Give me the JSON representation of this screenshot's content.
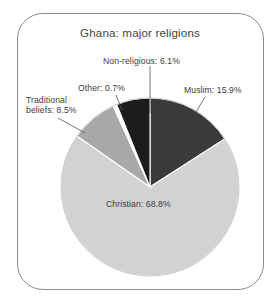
{
  "figure": {
    "title": "Ghana: major religions",
    "frame_color": "#8c8c8c",
    "background": "#ffffff",
    "label_color": "#3b3b3b"
  },
  "chart_data": {
    "type": "pie",
    "title": "Ghana: major religions",
    "xlabel": "",
    "ylabel": "",
    "legend": "none",
    "grid": false,
    "units": "percent",
    "start_angle_deg": 0,
    "direction": "clockwise",
    "categories": [
      "Muslim",
      "Christian",
      "Traditional beliefs",
      "Other",
      "Non-religious"
    ],
    "values": [
      15.9,
      68.8,
      8.5,
      0.7,
      6.1
    ],
    "colors": [
      "#3a3a3a",
      "#d2d2d2",
      "#a8a8a8",
      "#ffffff",
      "#1c1c1c"
    ],
    "slices": [
      {
        "label": "Muslim",
        "value": 15.9,
        "text": "Muslim: 15.9%",
        "color": "#3a3a3a"
      },
      {
        "label": "Christian",
        "value": 68.8,
        "text": "Christian: 68.8%",
        "color": "#d2d2d2"
      },
      {
        "label": "Traditional beliefs",
        "value": 8.5,
        "text": "Traditional beliefs: 8.5%",
        "color": "#a8a8a8"
      },
      {
        "label": "Other",
        "value": 0.7,
        "text": "Other: 0.7%",
        "color": "#ffffff"
      },
      {
        "label": "Non-religious",
        "value": 6.1,
        "text": "Non-religious: 6.1%",
        "color": "#1c1c1c"
      }
    ]
  },
  "labels": {
    "non_religious": "Non-religious: 6.1%",
    "muslim": "Muslim: 15.9%",
    "other": "Other: 0.7%",
    "traditional_line1": "Traditional",
    "traditional_line2": "beliefs: 8.5%",
    "christian": "Christian: 68.8%"
  }
}
